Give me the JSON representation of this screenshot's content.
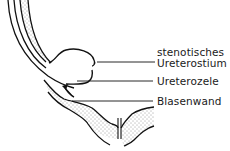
{
  "diagram": {
    "title": "",
    "labels": [
      {
        "id": "stenotic-ostium",
        "line1": "stenotisches",
        "line2": "Ureterostium"
      },
      {
        "id": "ureterocele",
        "text": "Ureterozele"
      },
      {
        "id": "bladder-wall",
        "text": "Blasenwand"
      }
    ],
    "colors": {
      "stroke": "#111111",
      "background": "#ffffff",
      "stipple": "#333333"
    }
  }
}
